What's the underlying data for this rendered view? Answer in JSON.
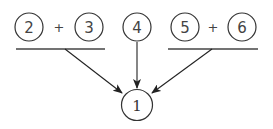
{
  "diagram": {
    "top_groups": [
      {
        "id": "group-left",
        "operands": [
          "2",
          "3"
        ],
        "operator": "+"
      },
      {
        "id": "group-middle",
        "operands": [
          "4"
        ]
      },
      {
        "id": "group-right",
        "operands": [
          "5",
          "6"
        ],
        "operator": "+"
      }
    ],
    "nodes": {
      "n2": "2",
      "n3": "3",
      "n4": "4",
      "n5": "5",
      "n6": "6",
      "target": "1"
    },
    "operators": {
      "left_plus": "+",
      "right_plus": "+"
    },
    "edges": [
      {
        "from": "group-left",
        "to": "target"
      },
      {
        "from": "group-middle",
        "to": "target"
      },
      {
        "from": "group-right",
        "to": "target"
      }
    ],
    "colors": {
      "stroke": "#333333",
      "text": "#444444",
      "background": "#ffffff"
    }
  }
}
